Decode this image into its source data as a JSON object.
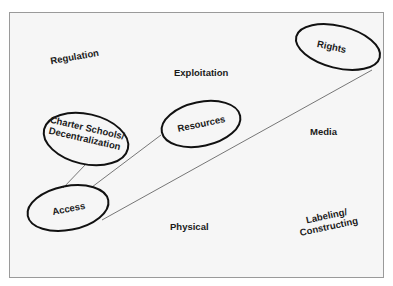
{
  "diagram": {
    "free_labels": {
      "regulation": "Regulation",
      "exploitation": "Exploitation",
      "media": "Media",
      "physical": "Physical",
      "labeling_line1": "Labeling/",
      "labeling_line2": "Constructing"
    },
    "nodes": {
      "rights": "Rights",
      "resources": "Resources",
      "charter_line1": "Charter Schools/",
      "charter_line2": "Decentralization",
      "access": "Access"
    },
    "edges": [
      {
        "from": "Charter Schools/Decentralization",
        "to": "Access"
      },
      {
        "from": "Resources",
        "to": "Access"
      },
      {
        "from": "Rights",
        "to": "Access"
      }
    ],
    "colors": {
      "background": "#f6f6f6",
      "frame": "#9a9a9a",
      "ellipse_stroke": "#111111",
      "connector": "#555555",
      "text": "#1a1a1a"
    }
  }
}
